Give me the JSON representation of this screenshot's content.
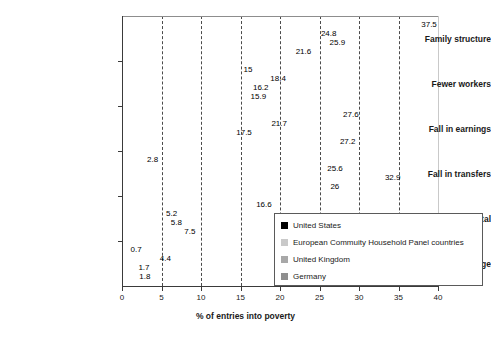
{
  "chart_data": {
    "type": "bar",
    "orientation": "horizontal",
    "title": "",
    "xlabel": "% of entries into poverty",
    "ylabel": "",
    "xlim": [
      0,
      40
    ],
    "xticks": [
      0,
      5,
      10,
      15,
      20,
      25,
      30,
      35,
      40
    ],
    "grid": true,
    "grid_axis": "x",
    "legend_position": "lower-right-inside",
    "categories": [
      "Family structure",
      "Fewer workers",
      "Fall in earnings",
      "Fall in transfers",
      "Fall in capital",
      "Other, without family change"
    ],
    "series": [
      {
        "name": "United States",
        "color": "#000000",
        "values": [
          37.5,
          15,
          27.6,
          2.8,
          16.6,
          0.7
        ],
        "labels": [
          "37.5",
          "15",
          "27.6",
          "2.8",
          "16.6",
          "0.7"
        ]
      },
      {
        "name": "European Commuity Household Panel countries",
        "color": "#c9c9c9",
        "values": [
          24.8,
          18.4,
          21.7,
          25.6,
          5.2,
          4.4
        ],
        "labels": [
          "24.8",
          "18.4",
          "21.7",
          "25.6",
          "5.2",
          "4.4"
        ]
      },
      {
        "name": "United Kingdom",
        "color": "#a8a8a8",
        "values": [
          25.9,
          16.2,
          17.5,
          32.9,
          5.8,
          1.7
        ],
        "labels": [
          "25.9",
          "16.2",
          "17.5",
          "32.9",
          "5.8",
          "1.7"
        ]
      },
      {
        "name": "Germany",
        "color": "#8f8f8f",
        "values": [
          21.6,
          15.9,
          27.2,
          26,
          7.5,
          1.8
        ],
        "labels": [
          "21.6",
          "15.9",
          "27.2",
          "26",
          "7.5",
          "1.8"
        ]
      }
    ]
  },
  "axis": {
    "tick_labels": [
      "0",
      "5",
      "10",
      "15",
      "20",
      "25",
      "30",
      "35",
      "40"
    ],
    "title": "% of entries into poverty"
  },
  "legend": {
    "items": [
      {
        "label": "United States",
        "color": "#000000"
      },
      {
        "label": "European Commuity Household Panel countries",
        "color": "#c9c9c9"
      },
      {
        "label": "United Kingdom",
        "color": "#a8a8a8"
      },
      {
        "label": "Germany",
        "color": "#8f8f8f"
      }
    ]
  }
}
